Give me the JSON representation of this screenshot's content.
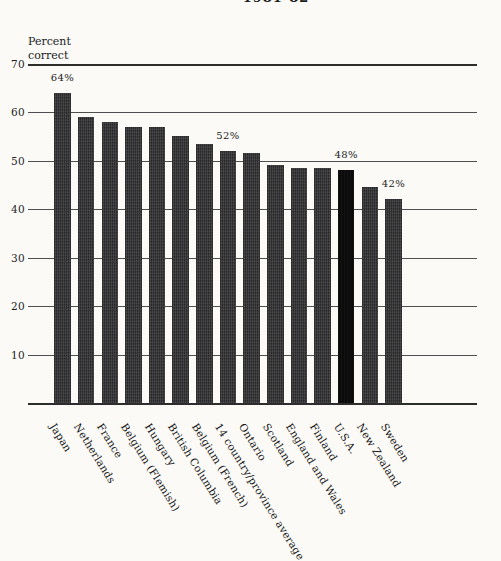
{
  "page": {
    "title_partial": "1981-82"
  },
  "chart_data": {
    "type": "bar",
    "title": "1981-82",
    "ylabel": "Percent correct",
    "xlabel": "",
    "categories": [
      "Japan",
      "Netherlands",
      "France",
      "Belgium (Flemish)",
      "Hungary",
      "British Columbia",
      "Belgium (French)",
      "14 country/province average",
      "Ontario",
      "Scotland",
      "England and Wales",
      "Finland",
      "U.S.A.",
      "New Zealand",
      "Sweden"
    ],
    "values": [
      64,
      59,
      58,
      57,
      57,
      55,
      53.5,
      52,
      51.5,
      49,
      48.5,
      48.5,
      48,
      44.5,
      42
    ],
    "value_labels": [
      {
        "index": 0,
        "text": "64%"
      },
      {
        "index": 7,
        "text": "52%"
      },
      {
        "index": 12,
        "text": "48%"
      },
      {
        "index": 14,
        "text": "42%"
      }
    ],
    "yticks": [
      70,
      60,
      50,
      40,
      30,
      20,
      10
    ],
    "ylim": [
      0,
      70
    ],
    "grid": "horizontal",
    "legend": "none",
    "highlight_category": "U.S.A.",
    "colors": {
      "bar": "#3a393b",
      "highlight_bar": "#0b0b0b",
      "gridline": "#4f4f4f",
      "axis": "#2d2d2d",
      "text": "#1e1e1e",
      "background": "#fbfaf7"
    }
  }
}
